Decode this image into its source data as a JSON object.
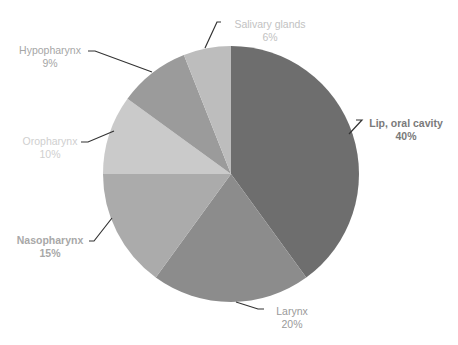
{
  "chart_data": {
    "type": "pie",
    "title": "",
    "start_angle_deg": 0,
    "direction": "clockwise",
    "slices": [
      {
        "label": "Lip, oral cavity",
        "value": 40,
        "value_label": "40%",
        "color": "#6e6e6e",
        "text_color": "#7a7a7a"
      },
      {
        "label": "Larynx",
        "value": 20,
        "value_label": "20%",
        "color": "#8c8c8c",
        "text_color": "#9a9a9a"
      },
      {
        "label": "Nasopharynx",
        "value": 15,
        "value_label": "15%",
        "color": "#ababab",
        "text_color": "#a8a8a8"
      },
      {
        "label": "Oropharynx",
        "value": 10,
        "value_label": "10%",
        "color": "#cacaca",
        "text_color": "#cfcfcf"
      },
      {
        "label": "Hypopharynx",
        "value": 9,
        "value_label": "9%",
        "color": "#9b9b9b",
        "text_color": "#a6a6a6"
      },
      {
        "label": "Salivary glands",
        "value": 6,
        "value_label": "6%",
        "color": "#bdbdbd",
        "text_color": "#c2c2c2"
      }
    ],
    "legend": "none",
    "data_labels": "outside with leader lines"
  }
}
